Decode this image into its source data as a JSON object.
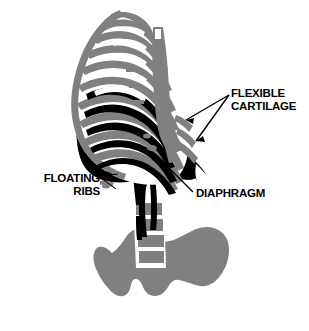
{
  "figure": {
    "colors": {
      "bone_gray": "#808080",
      "shadow_black": "#000000",
      "highlight_white": "#ffffff",
      "background": "#ffffff",
      "label_text": "#000000",
      "leader_line": "#000000"
    },
    "labels": [
      {
        "id": "flexible-cartilage",
        "line1": "FLEXIBLE",
        "line2": "CARTILAGE",
        "pointer_count": 2
      },
      {
        "id": "floating-ribs",
        "line1": "FLOATING",
        "line2": "RIBS",
        "pointer_count": 2
      },
      {
        "id": "diaphragm",
        "line1": "DIAPHRAGM",
        "line2": "",
        "pointer_count": 1
      }
    ],
    "parts": [
      "rib-cage",
      "sternum",
      "costal-cartilage",
      "floating-ribs",
      "diaphragm",
      "lumbar-spine",
      "pelvis"
    ]
  }
}
